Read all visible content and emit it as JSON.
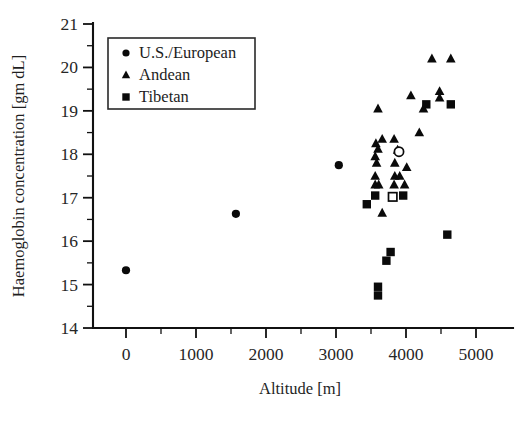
{
  "chart_data": {
    "type": "scatter",
    "title": "",
    "xlabel": "Altitude [m]",
    "ylabel": "Haemoglobin concentration [gm dL]",
    "xlim": [
      -600,
      5450
    ],
    "ylim": [
      14,
      21
    ],
    "xticks": [
      0,
      1000,
      2000,
      3000,
      4000,
      5000
    ],
    "xticklabels": [
      "0",
      "1000",
      "2000",
      "3000",
      "4000",
      "5000"
    ],
    "yticks": [
      14,
      15,
      16,
      17,
      18,
      19,
      20,
      21
    ],
    "yticklabels": [
      "14",
      "15",
      "16",
      "17",
      "18",
      "19",
      "20",
      "21"
    ],
    "x_minor_tick_interval": 500,
    "y_minor_tick_interval": 0.5,
    "grid": false,
    "legend_position": "upper left",
    "series": [
      {
        "name": "U.S./European",
        "marker": "circle",
        "filled": true,
        "color": "#0a0a0a",
        "points": [
          {
            "x": 0,
            "y": 15.33
          },
          {
            "x": 1570,
            "y": 16.63
          },
          {
            "x": 3040,
            "y": 17.75
          }
        ]
      },
      {
        "name": "Andean",
        "marker": "triangle",
        "filled": true,
        "color": "#0a0a0a",
        "points": [
          {
            "x": 4370,
            "y": 20.2
          },
          {
            "x": 4640,
            "y": 20.2
          },
          {
            "x": 4480,
            "y": 19.45
          },
          {
            "x": 4480,
            "y": 19.3
          },
          {
            "x": 4070,
            "y": 19.35
          },
          {
            "x": 4250,
            "y": 19.05
          },
          {
            "x": 3600,
            "y": 19.05
          },
          {
            "x": 4190,
            "y": 18.5
          },
          {
            "x": 3660,
            "y": 18.35
          },
          {
            "x": 3830,
            "y": 18.35
          },
          {
            "x": 3570,
            "y": 18.25
          },
          {
            "x": 3600,
            "y": 18.12
          },
          {
            "x": 3880,
            "y": 18.1
          },
          {
            "x": 3560,
            "y": 17.95
          },
          {
            "x": 3580,
            "y": 17.8
          },
          {
            "x": 3840,
            "y": 17.8
          },
          {
            "x": 4010,
            "y": 17.7
          },
          {
            "x": 3560,
            "y": 17.5
          },
          {
            "x": 3840,
            "y": 17.5
          },
          {
            "x": 3910,
            "y": 17.5
          },
          {
            "x": 3560,
            "y": 17.3
          },
          {
            "x": 3610,
            "y": 17.3
          },
          {
            "x": 3830,
            "y": 17.3
          },
          {
            "x": 3980,
            "y": 17.3
          },
          {
            "x": 3660,
            "y": 16.65
          }
        ]
      },
      {
        "name": "Tibetan",
        "marker": "square",
        "filled": true,
        "color": "#0a0a0a",
        "points": [
          {
            "x": 4290,
            "y": 19.15
          },
          {
            "x": 4640,
            "y": 19.15
          },
          {
            "x": 3560,
            "y": 17.05
          },
          {
            "x": 3960,
            "y": 17.05
          },
          {
            "x": 3440,
            "y": 16.85
          },
          {
            "x": 4590,
            "y": 16.15
          },
          {
            "x": 3780,
            "y": 15.75
          },
          {
            "x": 3720,
            "y": 15.55
          },
          {
            "x": 3600,
            "y": 14.95
          },
          {
            "x": 3600,
            "y": 14.75
          }
        ]
      },
      {
        "name": "Tibetan-open",
        "marker": "square",
        "filled": false,
        "color": "#0a0a0a",
        "points": [
          {
            "x": 3810,
            "y": 17.02
          }
        ]
      },
      {
        "name": "Andean-open",
        "marker": "circle-outline",
        "filled": false,
        "color": "#0a0a0a",
        "points": [
          {
            "x": 3900,
            "y": 18.06
          }
        ]
      }
    ]
  },
  "legend": {
    "entries": [
      {
        "label": "U.S./European",
        "marker": "circle-icon"
      },
      {
        "label": "Andean",
        "marker": "triangle-icon"
      },
      {
        "label": "Tibetan",
        "marker": "square-icon"
      }
    ]
  }
}
